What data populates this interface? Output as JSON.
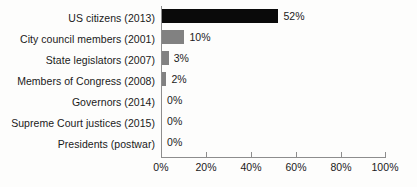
{
  "chart_data": {
    "type": "bar",
    "orientation": "horizontal",
    "title": "",
    "xlabel": "",
    "ylabel": "",
    "xlim": [
      0,
      100
    ],
    "grid": false,
    "legend": null,
    "xticks": [
      "0%",
      "20%",
      "40%",
      "60%",
      "80%",
      "100%"
    ],
    "xtick_values": [
      0,
      20,
      40,
      60,
      80,
      100
    ],
    "categories": [
      "US citizens (2013)",
      "City council members (2001)",
      "State legislators (2007)",
      "Members of Congress (2008)",
      "Governors (2014)",
      "Supreme Court justices (2015)",
      "Presidents (postwar)"
    ],
    "values": [
      52,
      10,
      3,
      2,
      0,
      0,
      0
    ],
    "value_labels": [
      "52%",
      "10%",
      "3%",
      "2%",
      "0%",
      "0%",
      "0%"
    ],
    "bar_colors": [
      "#0a0a0a",
      "#818181",
      "#818181",
      "#818181",
      "#818181",
      "#818181",
      "#818181"
    ]
  }
}
